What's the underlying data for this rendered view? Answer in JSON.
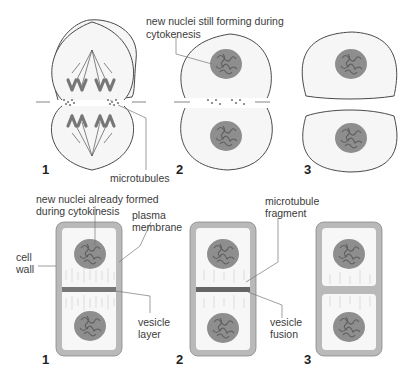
{
  "top_row": {
    "title": "Animal cell cytokinesis",
    "labels": {
      "nuclei_forming": "new nuclei still forming during",
      "nuclei_forming_2": "cytokenesis",
      "microtubules": "microtubules"
    },
    "steps": [
      "1",
      "2",
      "3"
    ]
  },
  "bottom_row": {
    "title": "Plant cell cytokinesis",
    "labels": {
      "nuclei_formed": "new nuclei already formed",
      "nuclei_formed_2": "during cytokinesis",
      "plasma_membrane": "plasma",
      "plasma_membrane_2": "membrane",
      "cell_wall": "cell",
      "cell_wall_2": "wall",
      "vesicle_layer": "vesicle",
      "vesicle_layer_2": "layer",
      "microtubule_fragment": "microtubule",
      "microtubule_fragment_2": "fragment",
      "vesicle_fusion": "vesicle",
      "vesicle_fusion_2": "fusion"
    },
    "steps": [
      "1",
      "2",
      "3"
    ]
  },
  "colors": {
    "outline": "#4a4a4a",
    "cytoplasm": "#f6f6f6",
    "nucleus": "#8e8e8e",
    "chromosome": "#6f6f6f",
    "cell_wall": "#b9b9b9",
    "leader_line": "#777777"
  }
}
